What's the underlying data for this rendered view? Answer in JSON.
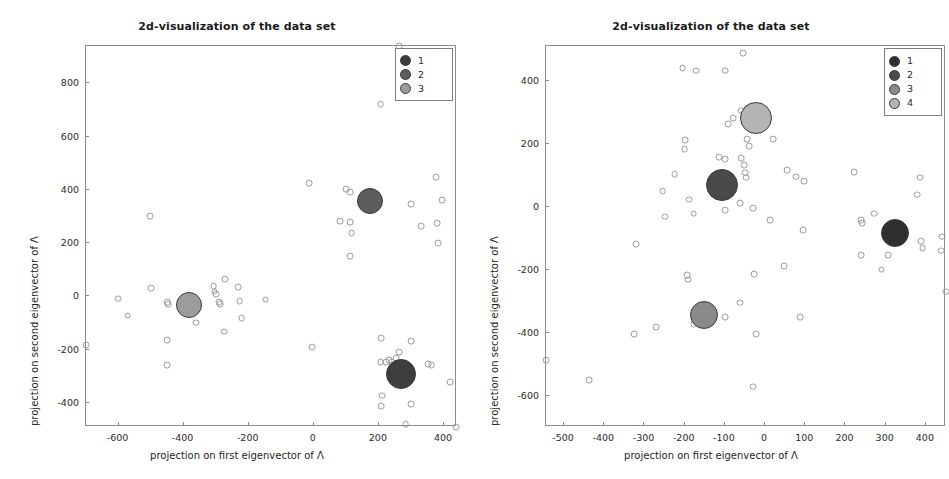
{
  "figure": {
    "background_color": "#ffffff",
    "axis_color": "#8c8c8c",
    "point_edge_color": "#9a9a9a"
  },
  "chart_data": [
    {
      "panel_id": "left",
      "type": "scatter",
      "title": "2d-visualization of the data set",
      "xlabel": "projection on first eigenvector of Λ",
      "ylabel": "projection on second eigenvector of Λ",
      "xlim": [
        -700,
        440
      ],
      "ylim": [
        -490,
        940
      ],
      "xticks": [
        -600,
        -400,
        -200,
        0,
        200,
        400
      ],
      "yticks": [
        -400,
        -200,
        0,
        200,
        400,
        600,
        800
      ],
      "xticklabels": [
        "-600",
        "-400",
        "-200",
        "0",
        "200",
        "400"
      ],
      "yticklabels": [
        "-400",
        "-200",
        "0",
        "200",
        "400",
        "600",
        "800"
      ],
      "grid": false,
      "legend_position": "upper right",
      "legend_title": "",
      "series": [
        {
          "name": "1",
          "label": "1",
          "color": "#3d3d3d",
          "centroid": {
            "x": 268,
            "y": -292,
            "radius_px": 15
          },
          "points": [
            {
              "x": 262,
              "y": 940
            },
            {
              "x": 205,
              "y": 722
            },
            {
              "x": 375,
              "y": 448
            },
            {
              "x": 300,
              "y": 348
            },
            {
              "x": 395,
              "y": 362
            },
            {
              "x": 330,
              "y": 263
            },
            {
              "x": 378,
              "y": 275
            },
            {
              "x": 382,
              "y": 200
            },
            {
              "x": 112,
              "y": 150
            },
            {
              "x": -15,
              "y": 425
            },
            {
              "x": 100,
              "y": 403
            },
            {
              "x": 112,
              "y": 392
            },
            {
              "x": 82,
              "y": 282
            },
            {
              "x": 112,
              "y": 280
            },
            {
              "x": 116,
              "y": 238
            },
            {
              "x": -5,
              "y": -190
            },
            {
              "x": 208,
              "y": -156
            },
            {
              "x": 300,
              "y": -168
            },
            {
              "x": 262,
              "y": -208
            },
            {
              "x": 252,
              "y": -232
            },
            {
              "x": 205,
              "y": -247
            },
            {
              "x": 222,
              "y": -245
            },
            {
              "x": 232,
              "y": -240
            },
            {
              "x": 240,
              "y": -247
            },
            {
              "x": 350,
              "y": -255
            },
            {
              "x": 362,
              "y": -258
            },
            {
              "x": 420,
              "y": -320
            },
            {
              "x": 210,
              "y": -372
            },
            {
              "x": 206,
              "y": -412
            },
            {
              "x": 300,
              "y": -405
            },
            {
              "x": 282,
              "y": -478
            },
            {
              "x": 438,
              "y": -490
            }
          ]
        },
        {
          "name": "2",
          "label": "2",
          "color": "#5c5c5c",
          "centroid": {
            "x": 172,
            "y": 360,
            "radius_px": 13
          },
          "points": []
        },
        {
          "name": "3",
          "label": "3",
          "color": "#9c9c9c",
          "centroid": {
            "x": -382,
            "y": -32,
            "radius_px": 13
          },
          "points": [
            {
              "x": -700,
              "y": -182
            },
            {
              "x": -602,
              "y": -8
            },
            {
              "x": -572,
              "y": -72
            },
            {
              "x": -502,
              "y": 302
            },
            {
              "x": -500,
              "y": 32
            },
            {
              "x": -452,
              "y": -22
            },
            {
              "x": -448,
              "y": -28
            },
            {
              "x": -452,
              "y": -165
            },
            {
              "x": -450,
              "y": -258
            },
            {
              "x": -362,
              "y": -98
            },
            {
              "x": -308,
              "y": 40
            },
            {
              "x": -305,
              "y": 18
            },
            {
              "x": -300,
              "y": 8
            },
            {
              "x": -290,
              "y": -22
            },
            {
              "x": -288,
              "y": -28
            },
            {
              "x": -272,
              "y": 65
            },
            {
              "x": -275,
              "y": -132
            },
            {
              "x": -232,
              "y": 35
            },
            {
              "x": -228,
              "y": -18
            },
            {
              "x": -222,
              "y": -82
            },
            {
              "x": -148,
              "y": -12
            }
          ]
        }
      ]
    },
    {
      "panel_id": "right",
      "type": "scatter",
      "title": "2d-visualization of the data set",
      "xlabel": "projection on first eigenvector of Λ",
      "ylabel": "projection on second eigenvector of Λ",
      "xlim": [
        -545,
        450
      ],
      "ylim": [
        -700,
        510
      ],
      "xticks": [
        -500,
        -400,
        -300,
        -200,
        -100,
        0,
        100,
        200,
        300,
        400
      ],
      "yticks": [
        -600,
        -400,
        -200,
        0,
        200,
        400
      ],
      "xticklabels": [
        "-500",
        "-400",
        "-300",
        "-200",
        "-100",
        "0",
        "100",
        "200",
        "300",
        "400"
      ],
      "yticklabels": [
        "-600",
        "-400",
        "-200",
        "0",
        "200",
        "400"
      ],
      "grid": false,
      "legend_position": "upper right",
      "legend_title": "",
      "series": [
        {
          "name": "1",
          "label": "1",
          "color": "#2f2f2f",
          "centroid": {
            "x": 322,
            "y": -85,
            "radius_px": 14
          },
          "points": [
            {
              "x": 222,
              "y": 110
            },
            {
              "x": 385,
              "y": 92
            },
            {
              "x": 378,
              "y": 38
            },
            {
              "x": 272,
              "y": -22
            },
            {
              "x": 238,
              "y": -42
            },
            {
              "x": 242,
              "y": -52
            },
            {
              "x": 340,
              "y": -78
            },
            {
              "x": 338,
              "y": -108
            },
            {
              "x": 388,
              "y": -110
            },
            {
              "x": 440,
              "y": -95
            },
            {
              "x": 392,
              "y": -132
            },
            {
              "x": 438,
              "y": -140
            },
            {
              "x": 238,
              "y": -155
            },
            {
              "x": 305,
              "y": -155
            },
            {
              "x": 290,
              "y": -200
            },
            {
              "x": 450,
              "y": -270
            }
          ]
        },
        {
          "name": "2",
          "label": "2",
          "color": "#4a4a4a",
          "centroid": {
            "x": -108,
            "y": 68,
            "radius_px": 16
          },
          "points": [
            {
              "x": -55,
              "y": 488
            },
            {
              "x": -205,
              "y": 440
            },
            {
              "x": -172,
              "y": 432
            },
            {
              "x": -100,
              "y": 432
            },
            {
              "x": -80,
              "y": 282
            },
            {
              "x": -92,
              "y": 262
            },
            {
              "x": -60,
              "y": 305
            },
            {
              "x": -42,
              "y": 312
            },
            {
              "x": -12,
              "y": 268
            },
            {
              "x": 20,
              "y": 215
            },
            {
              "x": -45,
              "y": 215
            },
            {
              "x": -40,
              "y": 192
            },
            {
              "x": -198,
              "y": 210
            },
            {
              "x": -200,
              "y": 182
            },
            {
              "x": -115,
              "y": 158
            },
            {
              "x": -100,
              "y": 150
            },
            {
              "x": -60,
              "y": 155
            },
            {
              "x": -52,
              "y": 132
            },
            {
              "x": -50,
              "y": 108
            },
            {
              "x": -48,
              "y": 92
            },
            {
              "x": -225,
              "y": 102
            },
            {
              "x": -255,
              "y": 48
            },
            {
              "x": 55,
              "y": 115
            },
            {
              "x": 78,
              "y": 95
            },
            {
              "x": 98,
              "y": 82
            },
            {
              "x": -190,
              "y": 22
            },
            {
              "x": -178,
              "y": -22
            },
            {
              "x": -100,
              "y": -10
            },
            {
              "x": -62,
              "y": 12
            },
            {
              "x": -30,
              "y": -5
            },
            {
              "x": -248,
              "y": -32
            },
            {
              "x": 12,
              "y": -42
            },
            {
              "x": 95,
              "y": -75
            },
            {
              "x": -320,
              "y": -118
            },
            {
              "x": 48,
              "y": -190
            },
            {
              "x": -28,
              "y": -215
            }
          ]
        },
        {
          "name": "3",
          "label": "3",
          "color": "#8a8a8a",
          "centroid": {
            "x": -152,
            "y": -345,
            "radius_px": 14
          },
          "points": [
            {
              "x": -195,
              "y": -218
            },
            {
              "x": -192,
              "y": -232
            },
            {
              "x": -545,
              "y": -488
            },
            {
              "x": -438,
              "y": -552
            },
            {
              "x": -325,
              "y": -405
            },
            {
              "x": -272,
              "y": -382
            },
            {
              "x": -178,
              "y": -372
            },
            {
              "x": -100,
              "y": -352
            },
            {
              "x": -62,
              "y": -305
            },
            {
              "x": -22,
              "y": -405
            },
            {
              "x": -30,
              "y": -572
            },
            {
              "x": 88,
              "y": -352
            }
          ]
        },
        {
          "name": "4",
          "label": "4",
          "color": "#b4b4b4",
          "centroid": {
            "x": -22,
            "y": 280,
            "radius_px": 16
          },
          "points": []
        }
      ]
    }
  ],
  "legend_left": {
    "items": [
      {
        "label": "1",
        "color": "#3d3d3d"
      },
      {
        "label": "2",
        "color": "#5c5c5c"
      },
      {
        "label": "3",
        "color": "#9c9c9c"
      }
    ]
  },
  "legend_right": {
    "items": [
      {
        "label": "1",
        "color": "#2f2f2f"
      },
      {
        "label": "2",
        "color": "#4a4a4a"
      },
      {
        "label": "3",
        "color": "#8a8a8a"
      },
      {
        "label": "4",
        "color": "#b4b4b4"
      }
    ]
  }
}
